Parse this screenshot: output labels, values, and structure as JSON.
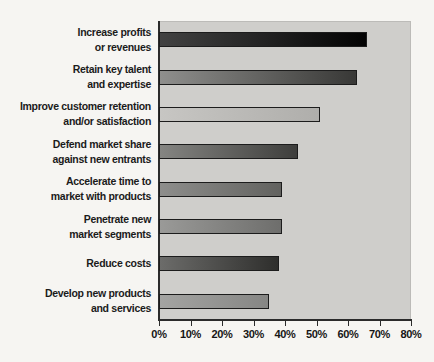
{
  "chart_data": {
    "type": "bar",
    "orientation": "horizontal",
    "title": "",
    "xlabel": "",
    "ylabel": "",
    "grid": false,
    "legend": false,
    "plot_background": "#cfcecb",
    "page_background": "#f6f5f2",
    "axis_line_color": "#2b2b2b",
    "bar_border_color": "#1c1c1c",
    "categories": [
      "Increase profits\nor revenues",
      "Retain key talent\nand expertise",
      "Improve customer retention\nand/or satisfaction",
      "Defend market share\nagainst new entrants",
      "Accelerate time to\nmarket with products",
      "Penetrate new\nmarket segments",
      "Reduce costs",
      "Develop new products\nand services"
    ],
    "values": [
      66,
      63,
      51,
      44,
      39,
      39,
      38,
      35
    ],
    "value_unit": "%",
    "bar_colors": [
      {
        "from": "#424242",
        "to": "#030303"
      },
      {
        "from": "#8f8f8d",
        "to": "#383836"
      },
      {
        "from": "#c7c6c3",
        "to": "#afaeab"
      },
      {
        "from": "#858582",
        "to": "#3e3e3c"
      },
      {
        "from": "#8e8e8c",
        "to": "#62625f"
      },
      {
        "from": "#9a9a98",
        "to": "#6e6e6c"
      },
      {
        "from": "#6c6c6a",
        "to": "#2e2e2c"
      },
      {
        "from": "#a4a4a2",
        "to": "#868684"
      }
    ],
    "x_axis": {
      "min": 0,
      "max": 80,
      "tick_step": 10,
      "tick_labels": [
        "0%",
        "10%",
        "20%",
        "30%",
        "40%",
        "50%",
        "60%",
        "70%",
        "80%"
      ]
    }
  }
}
